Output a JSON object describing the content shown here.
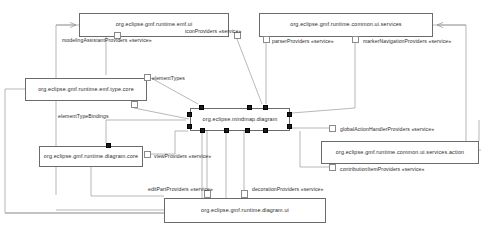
{
  "diagram": {
    "type": "component-diagram",
    "canvas": {
      "width": 489,
      "height": 233
    },
    "colors": {
      "node_border": "#6b6b6b",
      "node_fill": "#ffffff",
      "wire": "#9a9a9a",
      "port_fill": "#1a1a1a",
      "text": "#2b2b2b",
      "background": "#ffffff"
    }
  },
  "nodes": [
    {
      "id": "emf-ui",
      "label": "org.eclipse.gmf.runtime.emf.ui",
      "x": 79,
      "y": 13,
      "w": 150,
      "h": 24
    },
    {
      "id": "common-ui-services",
      "label": "org.eclipse.gmf.runtime.common.ui.services",
      "x": 259,
      "y": 13,
      "w": 174,
      "h": 24
    },
    {
      "id": "emf-type-core",
      "label": "org.eclipse.gmf.runtime.emf.type.core",
      "x": 25,
      "y": 78,
      "w": 122,
      "h": 23
    },
    {
      "id": "mindmap-diagram",
      "label": "org.eclipse.mindmap.diagram",
      "x": 190,
      "y": 108,
      "w": 100,
      "h": 23
    },
    {
      "id": "diagram-core",
      "label": "org.eclipse.gmf.runtime.diagram.core",
      "x": 39,
      "y": 146,
      "w": 104,
      "h": 21
    },
    {
      "id": "common-ui-services-action",
      "label": "org.eclipse.gmf.runtime.common.ui.services.action",
      "x": 321,
      "y": 141,
      "w": 158,
      "h": 23
    },
    {
      "id": "diagram-ui",
      "label": "org.eclipse.gmf.runtime.diagram.ui",
      "x": 164,
      "y": 198,
      "w": 162,
      "h": 25
    }
  ],
  "interfaces": [
    {
      "id": "modeling-assistant-providers",
      "label": "modelingAssistantProviders «service»",
      "owner": "emf-ui",
      "x": 62,
      "y": 38,
      "stub": {
        "x": 114,
        "y": 32,
        "w": 7,
        "h": 7
      }
    },
    {
      "id": "icon-providers",
      "label": "iconProviders «service»",
      "owner": "emf-ui",
      "x": 185,
      "y": 29,
      "stub": {
        "x": 234,
        "y": 32,
        "w": 7,
        "h": 7
      }
    },
    {
      "id": "parser-providers",
      "label": "parserProviders «service»",
      "owner": "common-ui-services",
      "x": 272,
      "y": 39,
      "stub": {
        "x": 263,
        "y": 36,
        "w": 7,
        "h": 7
      }
    },
    {
      "id": "marker-navigation-providers",
      "label": "markerNavigationProviders «service»",
      "owner": "common-ui-services",
      "x": 363,
      "y": 39,
      "stub": {
        "x": 352,
        "y": 36,
        "w": 7,
        "h": 7
      }
    },
    {
      "id": "element-types",
      "label": "elementTypes",
      "owner": "emf-type-core",
      "x": 152,
      "y": 76,
      "stub": {
        "x": 144,
        "y": 74,
        "w": 7,
        "h": 7
      }
    },
    {
      "id": "element-type-bindings",
      "label": "elementTypeBindings",
      "owner": "emf-type-core",
      "x": 58,
      "y": 114,
      "stub": {
        "x": 131,
        "y": 101,
        "w": 7,
        "h": 7
      }
    },
    {
      "id": "global-action-handler-providers",
      "label": "globalActionHandlerProviders «service»",
      "owner": "common-ui-services-action",
      "x": 340,
      "y": 127,
      "stub": {
        "x": 329,
        "y": 125,
        "w": 7,
        "h": 7
      }
    },
    {
      "id": "contribution-item-providers",
      "label": "contributionItemProviders «service»",
      "owner": "common-ui-services-action",
      "x": 340,
      "y": 167,
      "stub": {
        "x": 329,
        "y": 164,
        "w": 7,
        "h": 7
      }
    },
    {
      "id": "view-providers",
      "label": "viewProviders «service»",
      "owner": "diagram-core",
      "x": 154,
      "y": 154,
      "stub": {
        "x": 144,
        "y": 151,
        "w": 7,
        "h": 7
      }
    },
    {
      "id": "edit-part-providers",
      "label": "editPartProviders «service»",
      "owner": "diagram-ui",
      "x": 148,
      "y": 187,
      "stub": {
        "x": 204,
        "y": 190,
        "w": 7,
        "h": 8
      }
    },
    {
      "id": "decoration-providers",
      "label": "decorationProviders «service»",
      "owner": "diagram-ui",
      "x": 252,
      "y": 187,
      "stub": {
        "x": 241,
        "y": 190,
        "w": 7,
        "h": 8
      }
    }
  ],
  "ports": [
    {
      "id": "port-top-1",
      "owner": "mindmap-diagram",
      "side": "top",
      "x": 199,
      "y": 105
    },
    {
      "id": "port-top-2",
      "owner": "mindmap-diagram",
      "side": "top",
      "x": 247,
      "y": 105
    },
    {
      "id": "port-top-3",
      "owner": "mindmap-diagram",
      "side": "top",
      "x": 263,
      "y": 105
    },
    {
      "id": "port-left-1",
      "owner": "mindmap-diagram",
      "side": "left",
      "x": 187,
      "y": 112
    },
    {
      "id": "port-left-2",
      "owner": "mindmap-diagram",
      "side": "left",
      "x": 187,
      "y": 124
    },
    {
      "id": "port-right-1",
      "owner": "mindmap-diagram",
      "side": "right",
      "x": 287,
      "y": 112
    },
    {
      "id": "port-right-2",
      "owner": "mindmap-diagram",
      "side": "right",
      "x": 287,
      "y": 124
    },
    {
      "id": "port-bottom-1",
      "owner": "mindmap-diagram",
      "side": "bottom",
      "x": 200,
      "y": 128
    },
    {
      "id": "port-bottom-2",
      "owner": "mindmap-diagram",
      "side": "bottom",
      "x": 224,
      "y": 128
    },
    {
      "id": "port-bottom-3",
      "owner": "mindmap-diagram",
      "side": "bottom",
      "x": 245,
      "y": 128
    },
    {
      "id": "port-bottom-4",
      "owner": "mindmap-diagram",
      "side": "bottom",
      "x": 263,
      "y": 128
    },
    {
      "id": "port-diagram-core-top",
      "owner": "diagram-core",
      "side": "top",
      "x": 106,
      "y": 143
    }
  ],
  "wires": [
    {
      "id": "wire-emfui-to-left-rail",
      "d": "M 79 25 L 56 25 L 56 195"
    },
    {
      "id": "wire-emfui-arrow-in",
      "d": "M 56 25 L 76 25"
    },
    {
      "id": "wire-emfui-to-emftype",
      "d": "M 106 37 L 106 75"
    },
    {
      "id": "wire-iconproviders-down",
      "d": "M 237 39 L 262 104"
    },
    {
      "id": "wire-parser-down",
      "d": "M 266 43 L 266 104"
    },
    {
      "id": "wire-marker-down",
      "d": "M 355 43 L 355 108 L 292 113"
    },
    {
      "id": "wire-commonui-right-rail",
      "d": "M 433 25 L 466 25 L 466 150 L 481 150"
    },
    {
      "id": "wire-commonui-arrow",
      "d": "M 466 25 L 437 25"
    },
    {
      "id": "wire-elementtypes-to-node",
      "d": "M 151 78 L 198 104"
    },
    {
      "id": "wire-elementtypebindings-to-node",
      "d": "M 134 108 L 189 119"
    },
    {
      "id": "wire-emftype-left-rail",
      "d": "M 25 89 L 5 89 L 5 213 L 200 213"
    },
    {
      "id": "wire-globalaction-to-node",
      "d": "M 329 128 L 292 128"
    },
    {
      "id": "wire-contribution-to-node",
      "d": "M 329 167 L 300 167 L 300 131"
    },
    {
      "id": "wire-viewproviders-to-node",
      "d": "M 151 154 L 175 154 L 175 131 L 188 131"
    },
    {
      "id": "wire-diagramcore-top-up",
      "d": "M 106 143 L 106 120 L 186 120"
    },
    {
      "id": "wire-diagramui-editpart-up",
      "d": "M 207 190 L 207 131"
    },
    {
      "id": "wire-diagramui-decoration-up",
      "d": "M 244 190 L 244 131"
    },
    {
      "id": "wire-diagramui-to-diagramcore",
      "d": "M 164 210 L 56 210"
    },
    {
      "id": "wire-diagramcore-bottom",
      "d": "M 91 167 L 91 196 L 164 196"
    },
    {
      "id": "wire-left-rail-bottom",
      "d": "M 5 213 L 164 213"
    },
    {
      "id": "wire-mindmap-bottom-1",
      "d": "M 202 131 L 202 198"
    },
    {
      "id": "wire-mindmap-bottom-2",
      "d": "M 226 131 L 226 198"
    },
    {
      "id": "wire-action-right-rail",
      "d": "M 479 141 L 479 120"
    }
  ]
}
